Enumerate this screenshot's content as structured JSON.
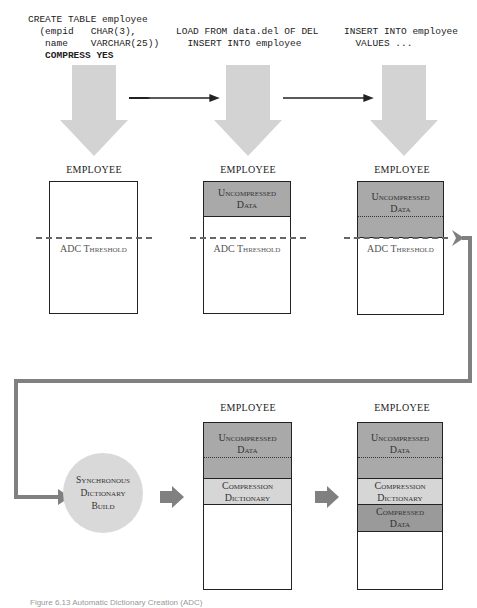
{
  "steps": [
    {
      "sql_lines": [
        "CREATE TABLE employee",
        "  (empid   CHAR(3),",
        "   name    VARCHAR(25))"
      ],
      "sql_bold_line": "   COMPRESS YES"
    },
    {
      "sql_lines": [
        "LOAD FROM data.del OF DEL",
        "  INSERT INTO employee"
      ]
    },
    {
      "sql_lines": [
        "INSERT INTO employee",
        "  VALUES ..."
      ]
    }
  ],
  "table_label": "EMPLOYEE",
  "segments": {
    "uncompressed": [
      "Uncompressed",
      "Data"
    ],
    "dictionary": [
      "Compression",
      "Dictionary"
    ],
    "compressed": [
      "Compressed",
      "Data"
    ]
  },
  "threshold_label": "ADC Threshold",
  "dictionary_build": [
    "Synchronous",
    "Dictionary",
    "Build"
  ],
  "caption": "Figure 6.13 Automatic Dictionary Creation (ADC)",
  "caption_note": "approximate — caption is cut off at the bottom edge and not fully legible",
  "colors": {
    "uncompressed": "#a9a9a9",
    "dictionary": "#d6d6d6",
    "compressed": "#9a9a9a",
    "big_arrow": "#d3d3d3",
    "flow_arrow": "#808080",
    "circle": "#d9d9d9"
  }
}
